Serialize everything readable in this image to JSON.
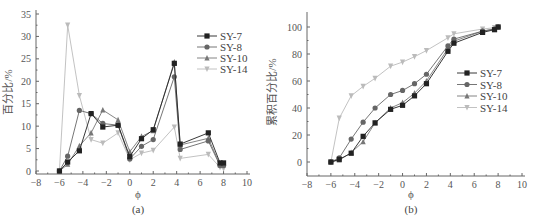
{
  "chart_data": [
    {
      "id": "a",
      "type": "line",
      "caption": "(a)",
      "title": "",
      "xlabel": "ϕ",
      "ylabel": "百分比/%",
      "xlim": [
        -8,
        10
      ],
      "ylim": [
        0,
        35
      ],
      "xticks": [
        -8,
        -6,
        -4,
        -2,
        0,
        2,
        4,
        6,
        8,
        10
      ],
      "yticks": [
        0,
        5,
        10,
        15,
        20,
        25,
        30,
        35
      ],
      "grid": false,
      "legend_position": "upper right",
      "x": [
        -6,
        -5.3,
        -4.3,
        -3.3,
        -2.3,
        -1,
        0,
        1,
        2,
        3.8,
        4.3,
        6.7,
        7.7,
        8
      ],
      "series": [
        {
          "name": "SY-7",
          "marker": "square",
          "color": "#222222",
          "values": [
            0,
            2,
            4.5,
            12.8,
            9.8,
            10.2,
            3.2,
            7.2,
            9.2,
            24,
            6,
            8.5,
            1.8,
            1.8
          ]
        },
        {
          "name": "SY-8",
          "marker": "circle",
          "color": "#666666",
          "values": [
            0,
            3.3,
            13.5,
            12.8,
            10.6,
            10.2,
            2.7,
            5.5,
            7,
            21,
            4.8,
            6.7,
            1.2,
            1.2
          ]
        },
        {
          "name": "SY-10",
          "marker": "triangle-up",
          "color": "#777777",
          "values": [
            0,
            1.5,
            5.6,
            8.5,
            13.6,
            11.4,
            4.3,
            7.7,
            9,
            24.3,
            5.8,
            7.3,
            1.4,
            1.4
          ]
        },
        {
          "name": "SY-14",
          "marker": "triangle-down",
          "color": "#bbbbbb",
          "values": [
            0,
            32.5,
            16.8,
            7,
            6.2,
            8.5,
            2.5,
            4,
            4.6,
            9.8,
            2.8,
            3.7,
            0.8,
            0.5
          ]
        }
      ]
    },
    {
      "id": "b",
      "type": "line",
      "caption": "(b)",
      "title": "",
      "xlabel": "ϕ",
      "ylabel": "累积百分比/%",
      "xlim": [
        -8,
        10
      ],
      "ylim": [
        -10,
        110
      ],
      "xticks": [
        -8,
        -6,
        -4,
        -2,
        0,
        2,
        4,
        6,
        8,
        10
      ],
      "yticks": [
        0,
        20,
        40,
        60,
        80,
        100
      ],
      "grid": false,
      "legend_position": "center right",
      "x": [
        -6,
        -5.3,
        -4.3,
        -3.3,
        -2.3,
        -1,
        0,
        1,
        2,
        3.8,
        4.3,
        6.7,
        7.7,
        8
      ],
      "series": [
        {
          "name": "SY-7",
          "marker": "square",
          "color": "#222222",
          "values": [
            0,
            2,
            6.5,
            19,
            29,
            39,
            42,
            49,
            58,
            82,
            88,
            96,
            98,
            100
          ]
        },
        {
          "name": "SY-8",
          "marker": "circle",
          "color": "#666666",
          "values": [
            0,
            3,
            17,
            29.5,
            40,
            50,
            53,
            58,
            65,
            86,
            91,
            97,
            98.5,
            100
          ]
        },
        {
          "name": "SY-10",
          "marker": "triangle-up",
          "color": "#777777",
          "values": [
            0,
            1.5,
            7,
            15,
            29,
            40,
            44,
            51,
            60,
            84,
            89.5,
            97,
            98.5,
            100
          ]
        },
        {
          "name": "SY-14",
          "marker": "triangle-down",
          "color": "#bbbbbb",
          "values": [
            0,
            32.5,
            49,
            56,
            62,
            71,
            74,
            78,
            82.5,
            92,
            95,
            98.5,
            99.5,
            100
          ]
        }
      ]
    }
  ]
}
